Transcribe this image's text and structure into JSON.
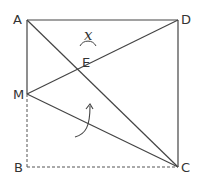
{
  "diagram": {
    "type": "geometry-folding-square",
    "labels": {
      "A": "A",
      "D": "D",
      "E": "E",
      "M": "M",
      "B": "B",
      "C": "C",
      "angle": "x"
    },
    "points": {
      "A": [
        27,
        20
      ],
      "D": [
        178,
        20
      ],
      "E": [
        88,
        50
      ],
      "M": [
        27,
        94
      ],
      "B": [
        27,
        167
      ],
      "C": [
        178,
        167
      ]
    },
    "solid_segments": [
      "AD",
      "DC",
      "AM",
      "AC",
      "MD",
      "MC"
    ],
    "dashed_segments": [
      "MB",
      "BC"
    ],
    "annotations": [
      "angle x at E between EA and ED",
      "curved fold arrow"
    ],
    "colors": {
      "line": "#444444",
      "text": "#333333",
      "background": "#ffffff"
    }
  }
}
